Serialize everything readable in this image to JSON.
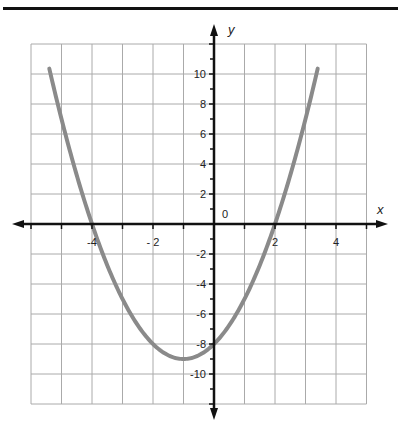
{
  "chart_data": {
    "type": "line",
    "title": "",
    "xlabel": "x",
    "ylabel": "y",
    "xlim": [
      -6,
      5
    ],
    "ylim": [
      -12,
      12
    ],
    "grid": true,
    "x_grid_step": 1,
    "y_grid_step": 2,
    "x_tick_labels": [
      {
        "value": -4,
        "label": "-4"
      },
      {
        "value": -2,
        "label": "- 2"
      },
      {
        "value": 2,
        "label": "2"
      },
      {
        "value": 4,
        "label": "4"
      }
    ],
    "y_tick_labels": [
      {
        "value": 10,
        "label": "10"
      },
      {
        "value": 8,
        "label": "8"
      },
      {
        "value": 6,
        "label": "6"
      },
      {
        "value": 4,
        "label": "4"
      },
      {
        "value": 2,
        "label": "2"
      },
      {
        "value": -2,
        "label": "-2"
      },
      {
        "value": -4,
        "label": "-4"
      },
      {
        "value": -6,
        "label": "-6"
      },
      {
        "value": -8,
        "label": "-8"
      },
      {
        "value": -10,
        "label": "-10"
      }
    ],
    "origin_label": "0",
    "series": [
      {
        "name": "parabola",
        "equation": "y = x^2 + 2x - 8",
        "color": "#8a8a8a",
        "x_range": [
          -5.4,
          3.4
        ],
        "key_points": [
          {
            "x": -4,
            "y": 0
          },
          {
            "x": 2,
            "y": 0
          },
          {
            "x": -1,
            "y": -9
          },
          {
            "x": 0,
            "y": -8
          }
        ]
      }
    ]
  },
  "colors": {
    "axis": "#111111",
    "grid": "#aaaaaa",
    "curve": "#8a8a8a"
  }
}
